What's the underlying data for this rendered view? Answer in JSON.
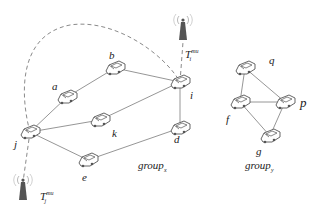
{
  "diagram": {
    "type": "vehicular-network",
    "colors": {
      "line": "#8a8a8a",
      "dashed": "#8a8a8a",
      "car_stroke": "#555555",
      "tower": "#555555",
      "text": "#222222"
    },
    "groups": [
      {
        "id": "group_x",
        "label_main": "group",
        "label_sub": "x",
        "nodes": [
          "a",
          "b",
          "k",
          "i",
          "d",
          "j",
          "e"
        ]
      },
      {
        "id": "group_y",
        "label_main": "group",
        "label_sub": "y",
        "nodes": [
          "q",
          "f",
          "p",
          "g"
        ]
      }
    ],
    "nodes": [
      {
        "id": "a",
        "label": "a",
        "x": 67,
        "y": 97
      },
      {
        "id": "b",
        "label": "b",
        "x": 115,
        "y": 68
      },
      {
        "id": "k",
        "label": "k",
        "x": 100,
        "y": 120
      },
      {
        "id": "i",
        "label": "i",
        "x": 180,
        "y": 82
      },
      {
        "id": "d",
        "label": "d",
        "x": 180,
        "y": 128
      },
      {
        "id": "j",
        "label": "j",
        "x": 30,
        "y": 132
      },
      {
        "id": "e",
        "label": "e",
        "x": 88,
        "y": 160
      },
      {
        "id": "q",
        "label": "q",
        "x": 245,
        "y": 68
      },
      {
        "id": "f",
        "label": "f",
        "x": 240,
        "y": 102
      },
      {
        "id": "p",
        "label": "p",
        "x": 285,
        "y": 102
      },
      {
        "id": "g",
        "label": "g",
        "x": 270,
        "y": 136
      }
    ],
    "edges": [
      [
        "a",
        "b"
      ],
      [
        "b",
        "i"
      ],
      [
        "a",
        "j"
      ],
      [
        "j",
        "k"
      ],
      [
        "k",
        "i"
      ],
      [
        "i",
        "d"
      ],
      [
        "j",
        "e"
      ],
      [
        "e",
        "d"
      ],
      [
        "q",
        "f"
      ],
      [
        "q",
        "p"
      ],
      [
        "f",
        "p"
      ],
      [
        "f",
        "g"
      ],
      [
        "p",
        "g"
      ]
    ],
    "towers": [
      {
        "id": "T_i",
        "label_main": "T",
        "label_sub": "i",
        "label_sup": "mu",
        "x": 183,
        "y": 30
      },
      {
        "id": "T_j",
        "label_main": "T",
        "label_sub": "j",
        "label_sup": "mu",
        "x": 23,
        "y": 190
      }
    ],
    "dashed_links": [
      "j–i (curved arc over top)",
      "i–T_i",
      "j–T_j"
    ]
  }
}
